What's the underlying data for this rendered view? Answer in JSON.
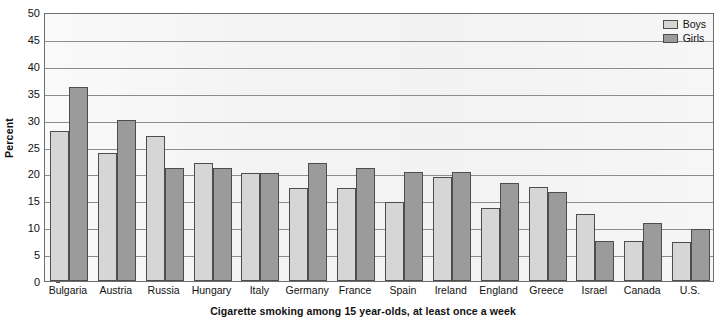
{
  "chart_data": {
    "type": "bar",
    "title": "",
    "caption": "Cigarette smoking among 15 year-olds, at least once a week",
    "xlabel": "",
    "ylabel": "Percent",
    "ylim": [
      0,
      50
    ],
    "ytick_step": 5,
    "yticks": [
      50,
      45,
      40,
      35,
      30,
      25,
      20,
      15,
      10,
      5,
      0
    ],
    "grid": true,
    "legend_position": "top-right",
    "categories": [
      "Bulgaria",
      "Austria",
      "Russia",
      "Hungary",
      "Italy",
      "Germany",
      "France",
      "Spain",
      "Ireland",
      "England",
      "Greece",
      "Israel",
      "Canada",
      "U.S."
    ],
    "series": [
      {
        "name": "Boys",
        "color": "#d6d6d6",
        "values": [
          27.8,
          23.8,
          27.0,
          22.0,
          20.0,
          17.3,
          17.3,
          14.7,
          19.3,
          13.5,
          17.4,
          12.5,
          7.5,
          7.3
        ]
      },
      {
        "name": "Girls",
        "color": "#9b9b9b",
        "values": [
          36.0,
          30.0,
          21.0,
          21.0,
          20.0,
          22.0,
          21.0,
          20.2,
          20.3,
          18.3,
          16.5,
          7.4,
          10.7,
          9.6
        ]
      }
    ]
  },
  "legend": {
    "items": [
      {
        "label": "Boys",
        "swatch": "boys"
      },
      {
        "label": "Girls",
        "swatch": "girls"
      }
    ]
  },
  "colors": {
    "boys": "#d6d6d6",
    "girls": "#9b9b9b",
    "axis": "#6e6e6e",
    "gridline": "#8c8c8c",
    "plot_background": "#f3f3f3",
    "text": "#111111"
  }
}
